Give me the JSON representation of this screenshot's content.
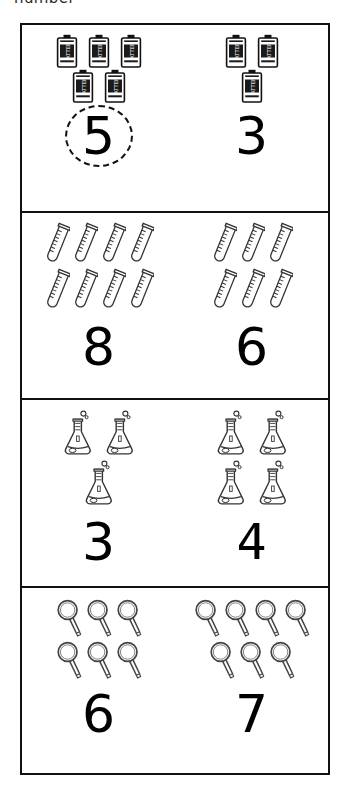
{
  "instruction": "number",
  "worksheet": {
    "title": "Count and circle the correct number",
    "rows": [
      {
        "id": "row-batteries",
        "icon": "battery-icon",
        "icon_label": "BATTERY",
        "cells": [
          {
            "id": "cell-batteries-left",
            "count": 5,
            "numeral": "5",
            "circled": true,
            "layout": [
              3,
              2
            ]
          },
          {
            "id": "cell-batteries-right",
            "count": 3,
            "numeral": "3",
            "circled": false,
            "layout": [
              2,
              1
            ]
          }
        ]
      },
      {
        "id": "row-test-tubes",
        "icon": "test-tube-icon",
        "icon_label": "",
        "cells": [
          {
            "id": "cell-test-tubes-left",
            "count": 8,
            "numeral": "8",
            "circled": false,
            "layout": [
              4,
              4
            ]
          },
          {
            "id": "cell-test-tubes-right",
            "count": 6,
            "numeral": "6",
            "circled": false,
            "layout": [
              3,
              3
            ]
          }
        ]
      },
      {
        "id": "row-flasks",
        "icon": "flask-icon",
        "icon_label": "",
        "cells": [
          {
            "id": "cell-flasks-left",
            "count": 3,
            "numeral": "3",
            "circled": false,
            "layout": [
              2,
              1
            ]
          },
          {
            "id": "cell-flasks-right",
            "count": 4,
            "numeral": "4",
            "circled": false,
            "layout": [
              2,
              2
            ]
          }
        ]
      },
      {
        "id": "row-magnifiers",
        "icon": "magnifying-glass-icon",
        "icon_label": "",
        "cells": [
          {
            "id": "cell-magnifiers-left",
            "count": 6,
            "numeral": "6",
            "circled": false,
            "layout": [
              3,
              3
            ]
          },
          {
            "id": "cell-magnifiers-right",
            "count": 7,
            "numeral": "7",
            "circled": false,
            "layout": [
              4,
              3
            ]
          }
        ]
      }
    ]
  },
  "colors": {
    "border": "#111111",
    "ink": "#000000",
    "paper": "#ffffff"
  }
}
